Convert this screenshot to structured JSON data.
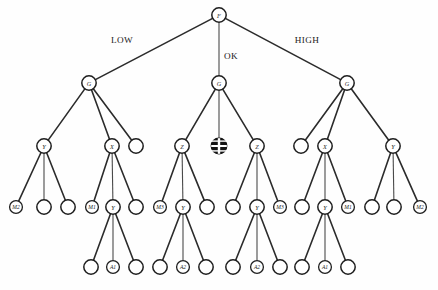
{
  "diagram": {
    "type": "tree",
    "geometry": {
      "width": 438,
      "height": 290,
      "levels_y": [
        15,
        83,
        146,
        207,
        267
      ],
      "radius_normal": 7.2,
      "radius_small": 6.4
    },
    "colors": {
      "edge": "#2b2b2b",
      "node_stroke": "#1e1e1e",
      "node_fill": "#ffffff",
      "blocked_fill": "#141414",
      "text": "#1b1b1b",
      "background": "#ffffff"
    },
    "edge_labels": [
      {
        "id": "edge-label-low",
        "text": "LOW",
        "x": 122,
        "y": 40
      },
      {
        "id": "edge-label-ok",
        "text": "OK",
        "x": 231,
        "y": 56
      },
      {
        "id": "edge-label-high",
        "text": "HIGH",
        "x": 307,
        "y": 40
      }
    ],
    "nodes": [
      {
        "id": "n-root",
        "label": "F",
        "x": 219,
        "y": 15,
        "level": 0,
        "kind": "normal"
      },
      {
        "id": "n-g-left",
        "label": "G",
        "x": 89,
        "y": 83,
        "level": 1,
        "kind": "normal"
      },
      {
        "id": "n-g-center",
        "label": "G",
        "x": 219,
        "y": 83,
        "level": 1,
        "kind": "normal"
      },
      {
        "id": "n-g-right",
        "label": "G",
        "x": 347,
        "y": 83,
        "level": 1,
        "kind": "normal"
      },
      {
        "id": "n-l2-y1",
        "label": "Y",
        "x": 44,
        "y": 146,
        "level": 2,
        "kind": "normal"
      },
      {
        "id": "n-l2-x1",
        "label": "X",
        "x": 112,
        "y": 146,
        "level": 2,
        "kind": "normal"
      },
      {
        "id": "n-l2-e1",
        "label": "",
        "x": 136,
        "y": 146,
        "level": 2,
        "kind": "normal"
      },
      {
        "id": "n-l2-z1",
        "label": "Z",
        "x": 182,
        "y": 146,
        "level": 2,
        "kind": "normal"
      },
      {
        "id": "n-l2-blocked",
        "label": "",
        "x": 219,
        "y": 146,
        "level": 2,
        "kind": "blocked"
      },
      {
        "id": "n-l2-z2",
        "label": "Z",
        "x": 257,
        "y": 146,
        "level": 2,
        "kind": "normal"
      },
      {
        "id": "n-l2-e2",
        "label": "",
        "x": 301,
        "y": 146,
        "level": 2,
        "kind": "normal"
      },
      {
        "id": "n-l2-x2",
        "label": "X",
        "x": 325,
        "y": 146,
        "level": 2,
        "kind": "normal"
      },
      {
        "id": "n-l2-y2",
        "label": "Y",
        "x": 393,
        "y": 146,
        "level": 2,
        "kind": "normal"
      },
      {
        "id": "n-l3-m2a",
        "label": "M2",
        "x": 16,
        "y": 207,
        "level": 3,
        "kind": "small"
      },
      {
        "id": "n-l3-e1",
        "label": "",
        "x": 44,
        "y": 207,
        "level": 3,
        "kind": "normal"
      },
      {
        "id": "n-l3-e2",
        "label": "",
        "x": 68,
        "y": 207,
        "level": 3,
        "kind": "normal"
      },
      {
        "id": "n-l3-m1a",
        "label": "M1",
        "x": 92,
        "y": 207,
        "level": 3,
        "kind": "small"
      },
      {
        "id": "n-l3-y1",
        "label": "Y",
        "x": 113,
        "y": 207,
        "level": 3,
        "kind": "normal"
      },
      {
        "id": "n-l3-e3",
        "label": "",
        "x": 136,
        "y": 207,
        "level": 3,
        "kind": "normal"
      },
      {
        "id": "n-l3-m3a",
        "label": "M3",
        "x": 160,
        "y": 207,
        "level": 3,
        "kind": "small"
      },
      {
        "id": "n-l3-y2",
        "label": "Y",
        "x": 183,
        "y": 207,
        "level": 3,
        "kind": "normal"
      },
      {
        "id": "n-l3-e4",
        "label": "",
        "x": 207,
        "y": 207,
        "level": 3,
        "kind": "normal"
      },
      {
        "id": "n-l3-e5",
        "label": "",
        "x": 233,
        "y": 207,
        "level": 3,
        "kind": "normal"
      },
      {
        "id": "n-l3-y3",
        "label": "Y",
        "x": 257,
        "y": 207,
        "level": 3,
        "kind": "normal"
      },
      {
        "id": "n-l3-m3b",
        "label": "M3",
        "x": 280,
        "y": 207,
        "level": 3,
        "kind": "small"
      },
      {
        "id": "n-l3-e6",
        "label": "",
        "x": 302,
        "y": 207,
        "level": 3,
        "kind": "normal"
      },
      {
        "id": "n-l3-y4",
        "label": "Y",
        "x": 325,
        "y": 207,
        "level": 3,
        "kind": "normal"
      },
      {
        "id": "n-l3-m1b",
        "label": "M1",
        "x": 348,
        "y": 207,
        "level": 3,
        "kind": "small"
      },
      {
        "id": "n-l3-e7",
        "label": "",
        "x": 372,
        "y": 207,
        "level": 3,
        "kind": "normal"
      },
      {
        "id": "n-l3-e8",
        "label": "",
        "x": 394,
        "y": 207,
        "level": 3,
        "kind": "normal"
      },
      {
        "id": "n-l3-m2b",
        "label": "M2",
        "x": 420,
        "y": 207,
        "level": 3,
        "kind": "small"
      },
      {
        "id": "n-l4-e1",
        "label": "",
        "x": 91,
        "y": 267,
        "level": 4,
        "kind": "normal"
      },
      {
        "id": "n-l4-a1a",
        "label": "A1",
        "x": 113,
        "y": 267,
        "level": 4,
        "kind": "small"
      },
      {
        "id": "n-l4-e2",
        "label": "",
        "x": 136,
        "y": 267,
        "level": 4,
        "kind": "normal"
      },
      {
        "id": "n-l4-e3",
        "label": "",
        "x": 160,
        "y": 267,
        "level": 4,
        "kind": "normal"
      },
      {
        "id": "n-l4-a2a",
        "label": "A2",
        "x": 183,
        "y": 267,
        "level": 4,
        "kind": "small"
      },
      {
        "id": "n-l4-e4",
        "label": "",
        "x": 206,
        "y": 267,
        "level": 4,
        "kind": "normal"
      },
      {
        "id": "n-l4-e5",
        "label": "",
        "x": 233,
        "y": 267,
        "level": 4,
        "kind": "normal"
      },
      {
        "id": "n-l4-a2b",
        "label": "A2",
        "x": 257,
        "y": 267,
        "level": 4,
        "kind": "small"
      },
      {
        "id": "n-l4-e6",
        "label": "",
        "x": 280,
        "y": 267,
        "level": 4,
        "kind": "normal"
      },
      {
        "id": "n-l4-e7",
        "label": "",
        "x": 302,
        "y": 267,
        "level": 4,
        "kind": "normal"
      },
      {
        "id": "n-l4-a1b",
        "label": "A1",
        "x": 325,
        "y": 267,
        "level": 4,
        "kind": "small"
      },
      {
        "id": "n-l4-e8",
        "label": "",
        "x": 348,
        "y": 267,
        "level": 4,
        "kind": "normal"
      }
    ],
    "edges": [
      {
        "from": "n-root",
        "to": "n-g-left"
      },
      {
        "from": "n-root",
        "to": "n-g-center"
      },
      {
        "from": "n-root",
        "to": "n-g-right"
      },
      {
        "from": "n-g-left",
        "to": "n-l2-y1"
      },
      {
        "from": "n-g-left",
        "to": "n-l2-x1"
      },
      {
        "from": "n-g-left",
        "to": "n-l2-e1"
      },
      {
        "from": "n-g-center",
        "to": "n-l2-z1"
      },
      {
        "from": "n-g-center",
        "to": "n-l2-blocked"
      },
      {
        "from": "n-g-center",
        "to": "n-l2-z2"
      },
      {
        "from": "n-g-right",
        "to": "n-l2-e2"
      },
      {
        "from": "n-g-right",
        "to": "n-l2-x2"
      },
      {
        "from": "n-g-right",
        "to": "n-l2-y2"
      },
      {
        "from": "n-l2-y1",
        "to": "n-l3-m2a"
      },
      {
        "from": "n-l2-y1",
        "to": "n-l3-e1"
      },
      {
        "from": "n-l2-y1",
        "to": "n-l3-e2"
      },
      {
        "from": "n-l2-x1",
        "to": "n-l3-m1a"
      },
      {
        "from": "n-l2-x1",
        "to": "n-l3-y1"
      },
      {
        "from": "n-l2-x1",
        "to": "n-l3-e3"
      },
      {
        "from": "n-l2-z1",
        "to": "n-l3-m3a"
      },
      {
        "from": "n-l2-z1",
        "to": "n-l3-y2"
      },
      {
        "from": "n-l2-z1",
        "to": "n-l3-e4"
      },
      {
        "from": "n-l2-z2",
        "to": "n-l3-e5"
      },
      {
        "from": "n-l2-z2",
        "to": "n-l3-y3"
      },
      {
        "from": "n-l2-z2",
        "to": "n-l3-m3b"
      },
      {
        "from": "n-l2-x2",
        "to": "n-l3-e6"
      },
      {
        "from": "n-l2-x2",
        "to": "n-l3-y4"
      },
      {
        "from": "n-l2-x2",
        "to": "n-l3-m1b"
      },
      {
        "from": "n-l2-y2",
        "to": "n-l3-e7"
      },
      {
        "from": "n-l2-y2",
        "to": "n-l3-e8"
      },
      {
        "from": "n-l2-y2",
        "to": "n-l3-m2b"
      },
      {
        "from": "n-l3-y1",
        "to": "n-l4-e1"
      },
      {
        "from": "n-l3-y1",
        "to": "n-l4-a1a"
      },
      {
        "from": "n-l3-y1",
        "to": "n-l4-e2"
      },
      {
        "from": "n-l3-y2",
        "to": "n-l4-e3"
      },
      {
        "from": "n-l3-y2",
        "to": "n-l4-a2a"
      },
      {
        "from": "n-l3-y2",
        "to": "n-l4-e4"
      },
      {
        "from": "n-l3-y3",
        "to": "n-l4-e5"
      },
      {
        "from": "n-l3-y3",
        "to": "n-l4-a2b"
      },
      {
        "from": "n-l3-y3",
        "to": "n-l4-e6"
      },
      {
        "from": "n-l3-y4",
        "to": "n-l4-e7"
      },
      {
        "from": "n-l3-y4",
        "to": "n-l4-a1b"
      },
      {
        "from": "n-l3-y4",
        "to": "n-l4-e8"
      }
    ]
  }
}
